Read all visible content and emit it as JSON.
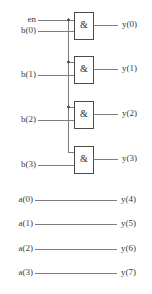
{
  "diagram": {
    "colors": {
      "wire": "#7d7d7d",
      "gate_border": "#4a4a4a",
      "gate_fill": "#ffffff",
      "text": "#3a3a3a",
      "junction": "#5a5a5a",
      "background": "#ffffff"
    },
    "gate_symbol": "&",
    "enable": {
      "label": "en",
      "x_label": 22,
      "y": 20
    },
    "gates": [
      {
        "id": "and-gate-0",
        "symbol": "&",
        "input_enable_y": 20,
        "input_data_label": "b(0)",
        "input_data_y": 31,
        "output_label": "y(0)",
        "output_y": 25,
        "box": {
          "x": 74,
          "y": 12,
          "w": 19,
          "h": 27
        },
        "junction": true
      },
      {
        "id": "and-gate-1",
        "symbol": "&",
        "input_enable_y": 62,
        "input_data_label": "b(1)",
        "input_data_y": 75,
        "output_label": "y(1)",
        "output_y": 69,
        "box": {
          "x": 74,
          "y": 56,
          "w": 19,
          "h": 27
        },
        "junction": true
      },
      {
        "id": "and-gate-2",
        "symbol": "&",
        "input_enable_y": 107,
        "input_data_label": "b(2)",
        "input_data_y": 120,
        "output_label": "y(2)",
        "output_y": 114,
        "box": {
          "x": 74,
          "y": 101,
          "w": 19,
          "h": 27
        },
        "junction": true
      },
      {
        "id": "and-gate-3",
        "symbol": "&",
        "input_enable_y": 152,
        "input_data_label": "b(3)",
        "input_data_y": 165,
        "output_label": "y(3)",
        "output_y": 159,
        "box": {
          "x": 74,
          "y": 146,
          "w": 19,
          "h": 27
        },
        "junction": false
      }
    ],
    "bus": {
      "x": 68,
      "y_top": 20,
      "y_bottom": 152
    },
    "passthrough": [
      {
        "id": "wire-a0",
        "input_label": "a(0)",
        "output_label": "y(4)",
        "y": 200
      },
      {
        "id": "wire-a1",
        "input_label": "a(1)",
        "output_label": "y(5)",
        "y": 224
      },
      {
        "id": "wire-a2",
        "input_label": "a(2)",
        "output_label": "y(6)",
        "y": 249
      },
      {
        "id": "wire-a3",
        "input_label": "a(3)",
        "output_label": "y(7)",
        "y": 273
      }
    ],
    "geometry": {
      "input_wire_start_x": 38,
      "input_label_right_x": 36,
      "output_wire_end_x": 118,
      "output_label_x": 122,
      "passthrough_wire_start_x": 35,
      "passthrough_wire_end_x": 117
    }
  }
}
